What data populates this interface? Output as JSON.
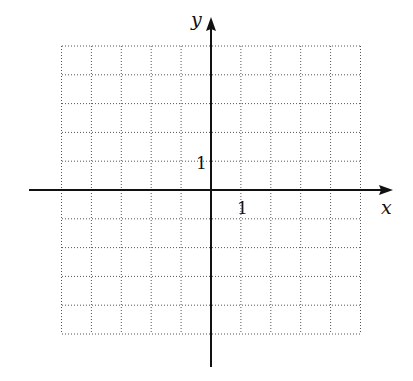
{
  "chart_data": {
    "type": "scatter",
    "title": "",
    "xlabel": "x",
    "ylabel": "y",
    "xlim": [
      -5,
      5
    ],
    "ylim": [
      -5,
      5
    ],
    "grid": true,
    "grid_style": "dotted",
    "tick_labels": {
      "x": [
        "1"
      ],
      "y": [
        "1"
      ]
    },
    "x_tick_label_value": 1,
    "y_tick_label_value": 1,
    "series": [],
    "axis_arrows": {
      "x": "positive",
      "y": "positive"
    }
  },
  "labels": {
    "x_axis": "x",
    "y_axis": "y",
    "x_tick": "1",
    "y_tick": "1"
  },
  "colors": {
    "axis": "#111111",
    "grid": "#555555"
  }
}
